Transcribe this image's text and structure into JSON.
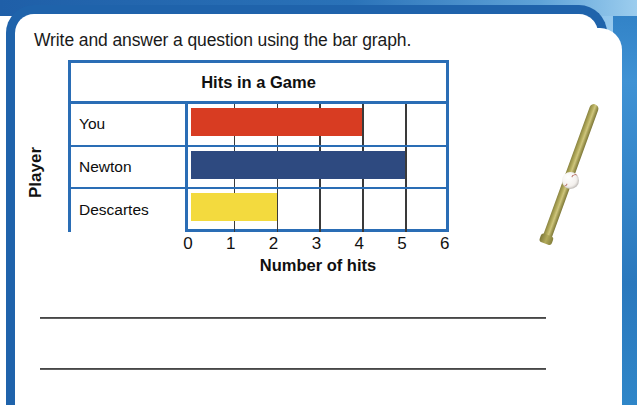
{
  "instruction": "Write and answer a question using the bar graph.",
  "graph": {
    "title": "Hits in a Game",
    "y_axis_label": "Player",
    "x_axis_label": "Number of hits",
    "tick_labels": [
      "0",
      "1",
      "2",
      "3",
      "4",
      "5",
      "6"
    ]
  },
  "chart_data": {
    "type": "bar",
    "orientation": "horizontal",
    "title": "Hits in a Game",
    "xlabel": "Number of hits",
    "ylabel": "Player",
    "categories": [
      "You",
      "Newton",
      "Descartes"
    ],
    "values": [
      4,
      5,
      2
    ],
    "colors": [
      "#D83C22",
      "#2E4A80",
      "#F3DA3E"
    ],
    "xlim": [
      0,
      6
    ],
    "xticks": [
      0,
      1,
      2,
      3,
      4,
      5,
      6
    ],
    "grid": true,
    "legend": "none",
    "bars": [
      {
        "label": "You",
        "value": 4,
        "color": "#D83C22"
      },
      {
        "label": "Newton",
        "value": 5,
        "color": "#2E4A80"
      },
      {
        "label": "Descartes",
        "value": 2,
        "color": "#F3DA3E"
      }
    ]
  },
  "answer_lines": [
    "",
    ""
  ],
  "decorations": {
    "bat": "baseball-bat",
    "ball": "baseball"
  },
  "colors": {
    "frame_blue": "#1F63AB",
    "grid_blue": "#2A6DB5",
    "bar_red": "#D83C22",
    "bar_blue": "#2E4A80",
    "bar_yellow": "#F3DA3E"
  }
}
